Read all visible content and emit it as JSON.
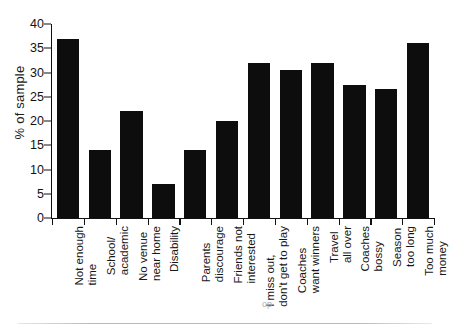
{
  "chart_data": {
    "type": "bar",
    "title": "",
    "xlabel": "",
    "ylabel": "% of sample",
    "ylim": [
      0,
      40
    ],
    "ytick_step": 5,
    "yticks": [
      0,
      5,
      10,
      15,
      20,
      25,
      30,
      35,
      40
    ],
    "grid": false,
    "legend": false,
    "bar_color": "#0d0d0d",
    "categories": [
      "Not enough time",
      "School/ academic",
      "No venue near home",
      "Disability",
      "Parents discourage",
      "Friends not interested",
      "I miss out, don't get to play",
      "Coaches want winners",
      "Travel all over",
      "Coaches bossy",
      "Season too long",
      "Too much money"
    ],
    "category_lines": [
      [
        "Not enough",
        "time"
      ],
      [
        "School/",
        "academic"
      ],
      [
        "No venue",
        "near home"
      ],
      [
        "Disability",
        ""
      ],
      [
        "Parents",
        "discourage"
      ],
      [
        "Friends not",
        "interested"
      ],
      [
        "I miss out,",
        "don't get to play"
      ],
      [
        "Coaches",
        "want winners"
      ],
      [
        "Travel",
        "all over"
      ],
      [
        "Coaches",
        "bossy"
      ],
      [
        "Season",
        "too long"
      ],
      [
        "Too much",
        "money"
      ]
    ],
    "values": [
      37,
      14,
      22,
      7,
      14,
      20,
      32,
      30.5,
      32,
      27.5,
      26.5,
      36
    ]
  }
}
